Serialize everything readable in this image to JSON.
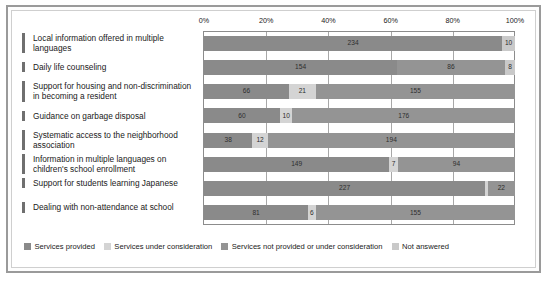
{
  "chart_data": {
    "type": "bar",
    "subtype": "stacked-horizontal-100pct",
    "title": "",
    "xlabel": "",
    "ylabel": "",
    "xlim": [
      0,
      100
    ],
    "x_tick_labels": [
      "0%",
      "20%",
      "40%",
      "60%",
      "80%",
      "100%"
    ],
    "x_tick_values": [
      0,
      20,
      40,
      60,
      80,
      100
    ],
    "grid": true,
    "legend_position": "bottom",
    "categories": [
      "Local information offered in multiple languages",
      "Daily life counseling",
      "Support for housing and non-discrimination in becoming a resident",
      "Guidance on garbage disposal",
      "Systematic access to the neighborhood association",
      "Information in multiple languages on children's school enrollment",
      "Support for students learning Japanese",
      "Dealing with non-attendance at school"
    ],
    "series": [
      {
        "name": "Services provided",
        "color": "#8a8a8a",
        "values": [
          234,
          154,
          66,
          60,
          38,
          149,
          227,
          81
        ]
      },
      {
        "name": "Services under consideration",
        "color": "#d4d4d4",
        "values": [
          0,
          0,
          21,
          10,
          12,
          7,
          2,
          6
        ]
      },
      {
        "name": "Services not provided or under consideration",
        "color": "#949494",
        "values": [
          0,
          86,
          155,
          176,
          194,
          94,
          22,
          155
        ]
      },
      {
        "name": "Not answered",
        "color": "#c9c9c9",
        "values": [
          10,
          8,
          0,
          0,
          0,
          0,
          0,
          0
        ]
      }
    ],
    "bar_labels": [
      [
        "234",
        "",
        "",
        "10"
      ],
      [
        "154",
        "",
        "86",
        "8"
      ],
      [
        "66",
        "21",
        "155",
        ""
      ],
      [
        "60",
        "10",
        "176",
        ""
      ],
      [
        "38",
        "12",
        "194",
        ""
      ],
      [
        "149",
        "7",
        "94",
        ""
      ],
      [
        "227",
        "2",
        "22",
        ""
      ],
      [
        "81",
        "6",
        "155",
        ""
      ]
    ]
  },
  "legend": {
    "items": [
      {
        "label": "Services provided",
        "color": "#8a8a8a"
      },
      {
        "label": "Services under consideration",
        "color": "#d4d4d4"
      },
      {
        "label": "Services not provided or under consideration",
        "color": "#949494"
      },
      {
        "label": "Not answered",
        "color": "#c9c9c9"
      }
    ]
  }
}
